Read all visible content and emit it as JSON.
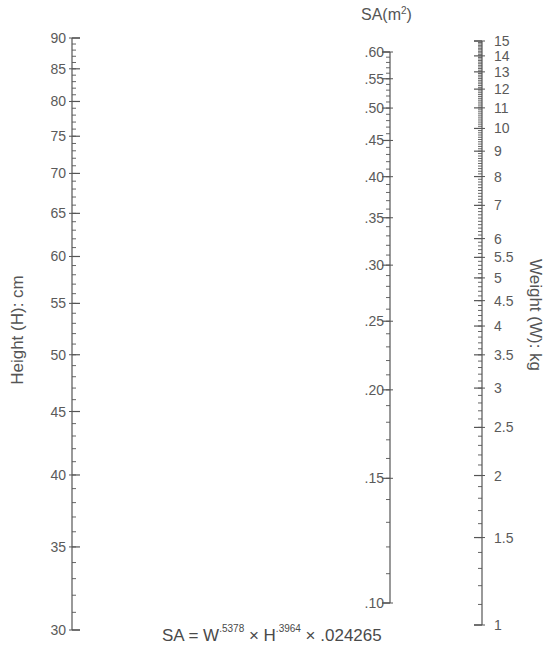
{
  "chart_data": {
    "type": "nomogram",
    "formula": {
      "prefix": "SA  =  W",
      "w_exp": ".5378",
      "mid": "  ×  H",
      "h_exp": ".3964",
      "suffix": "  ×  .024265"
    },
    "axes": [
      {
        "id": "height",
        "label": "Height (H): cm",
        "scale": "log",
        "range": [
          30,
          90
        ],
        "major_ticks": [
          30,
          35,
          40,
          45,
          50,
          55,
          60,
          65,
          70,
          75,
          80,
          85,
          90
        ],
        "tick_labels": [
          "30",
          "35",
          "40",
          "45",
          "50",
          "55",
          "60",
          "65",
          "70",
          "75",
          "80",
          "85",
          "90"
        ],
        "minor_step": 1,
        "label_side": "left"
      },
      {
        "id": "surface_area",
        "label": "SA(m",
        "label_sup": "2",
        "label_close": ")",
        "scale": "log",
        "range": [
          0.1,
          0.6
        ],
        "major_ticks": [
          0.1,
          0.15,
          0.2,
          0.25,
          0.3,
          0.35,
          0.4,
          0.45,
          0.5,
          0.55,
          0.6
        ],
        "tick_labels": [
          ".10",
          ".15",
          ".20",
          ".25",
          ".30",
          ".35",
          ".40",
          ".45",
          ".50",
          ".55",
          ".60"
        ],
        "minor_step": 0.01,
        "label_side": "left"
      },
      {
        "id": "weight",
        "label": "Weight (W): kg",
        "scale": "log",
        "range": [
          1,
          15
        ],
        "major_ticks": [
          1,
          1.5,
          2,
          2.5,
          3,
          3.5,
          4,
          4.5,
          5,
          5.5,
          6,
          7,
          8,
          9,
          10,
          11,
          12,
          13,
          14,
          15
        ],
        "tick_labels": [
          "1",
          "1.5",
          "2",
          "2.5",
          "3",
          "3.5",
          "4",
          "4.5",
          "5",
          "5.5",
          "6",
          "7",
          "8",
          "9",
          "10",
          "11",
          "12",
          "13",
          "14",
          "15"
        ],
        "minor_step": 0.1,
        "label_side": "right"
      }
    ]
  },
  "labels": {
    "sa_title": "SA(m",
    "sa_sup": "2",
    "sa_close": ")",
    "height_axis": "Height (H): cm",
    "weight_axis": "Weight (W): kg"
  }
}
